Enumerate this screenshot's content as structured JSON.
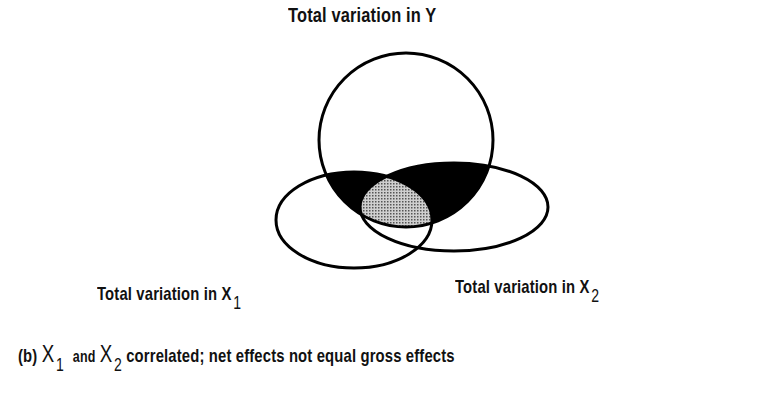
{
  "diagram": {
    "title_y": "Total variation in Y",
    "label_x1": {
      "text": "Total variation in X",
      "sub": "1"
    },
    "label_x2": {
      "text": "Total variation in X",
      "sub": "2"
    },
    "caption": {
      "prefix": "(b)",
      "var1": "X",
      "var1_sub": "1",
      "mid": "and",
      "var2": "X",
      "var2_sub": "2",
      "rest": "correlated; net effects not equal gross effects"
    },
    "shapes": {
      "circle_y": {
        "cx": 406,
        "cy": 140,
        "r": 87
      },
      "ellipse_x1": {
        "cx": 354,
        "cy": 220,
        "rx": 78,
        "ry": 48
      },
      "ellipse_x2": {
        "cx": 454,
        "cy": 207,
        "rx": 94,
        "ry": 44
      }
    },
    "colors": {
      "stroke": "#000000",
      "solid_fill": "#000000",
      "overlap_fill": "#9a9a9a",
      "background": "#ffffff"
    }
  }
}
